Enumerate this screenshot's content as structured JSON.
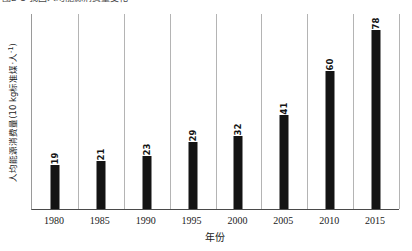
{
  "caption": {
    "text": "图2-1 我国人均能源消费量变化"
  },
  "chart_data": {
    "type": "bar",
    "title": "",
    "subtitle": "",
    "xlabel": "年份",
    "ylabel": "人均能源消费量(10 kg标准煤·人-1)",
    "ylabel_parts": {
      "main": "人均能源消费量(10 kg标准煤·人",
      "superscript": "-1",
      "tail": ")"
    },
    "categories": [
      "1980",
      "1985",
      "1990",
      "1995",
      "2000",
      "2005",
      "2010",
      "2015"
    ],
    "values": [
      19,
      21,
      23,
      29,
      32,
      41,
      60,
      78
    ],
    "value_labels": [
      "19",
      "21",
      "23",
      "29",
      "32",
      "41",
      "60",
      "78"
    ],
    "series": [
      {
        "name": "人均能源消费量",
        "values": [
          19,
          21,
          23,
          29,
          32,
          41,
          60,
          78
        ]
      }
    ],
    "ylim": [
      0,
      85
    ],
    "xlim_labels": [
      "1980",
      "2015"
    ],
    "grid": "vertical-category-separators",
    "legend": "none",
    "bar_color": "#141414",
    "gridline_color": "#b4b4b4",
    "axis_color": "#4a4a4a",
    "value_label_rotation": "-90",
    "y_tick_labels": []
  }
}
